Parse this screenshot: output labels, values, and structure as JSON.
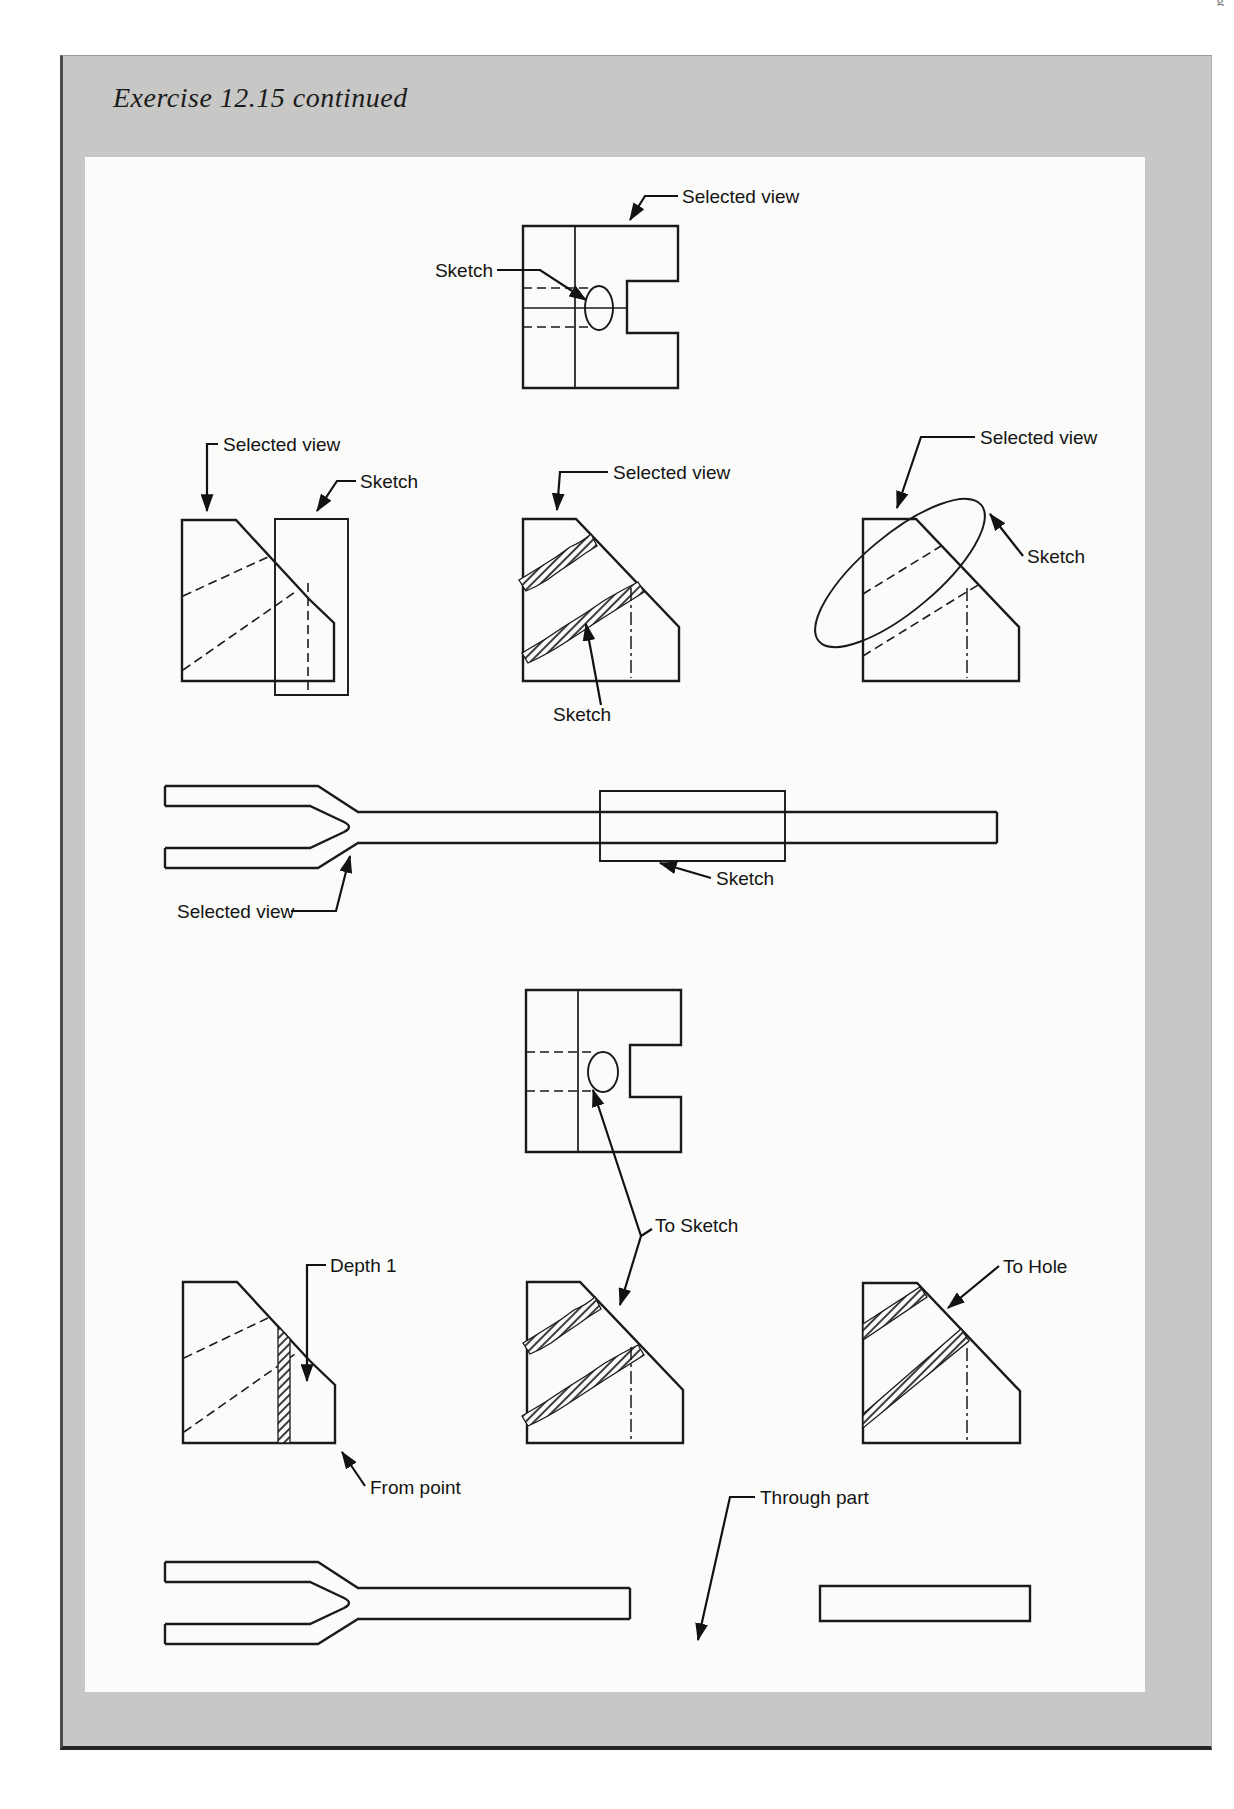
{
  "page": {
    "title": "Exercise 12.15 continued",
    "header_fragment": "g"
  },
  "labels": {
    "row1": {
      "selected_view": "Selected view",
      "sketch": "Sketch"
    },
    "row2_left": {
      "selected_view": "Selected view",
      "sketch": "Sketch"
    },
    "row2_middle": {
      "selected_view": "Selected view",
      "sketch": "Sketch"
    },
    "row2_right": {
      "selected_view": "Selected view",
      "sketch": "Sketch"
    },
    "row3": {
      "selected_view": "Selected view",
      "sketch": "Sketch"
    },
    "row4": {
      "to_sketch": "To Sketch"
    },
    "row5_left": {
      "depth": "Depth 1",
      "from_point": "From point"
    },
    "row5_right": {
      "to_hole": "To Hole"
    },
    "bottom": {
      "through_part": "Through part"
    }
  },
  "colors": {
    "frame_gray": "#c7c7c5",
    "panel_white": "#fbfbf9",
    "line_black": "#1a1a1a"
  }
}
